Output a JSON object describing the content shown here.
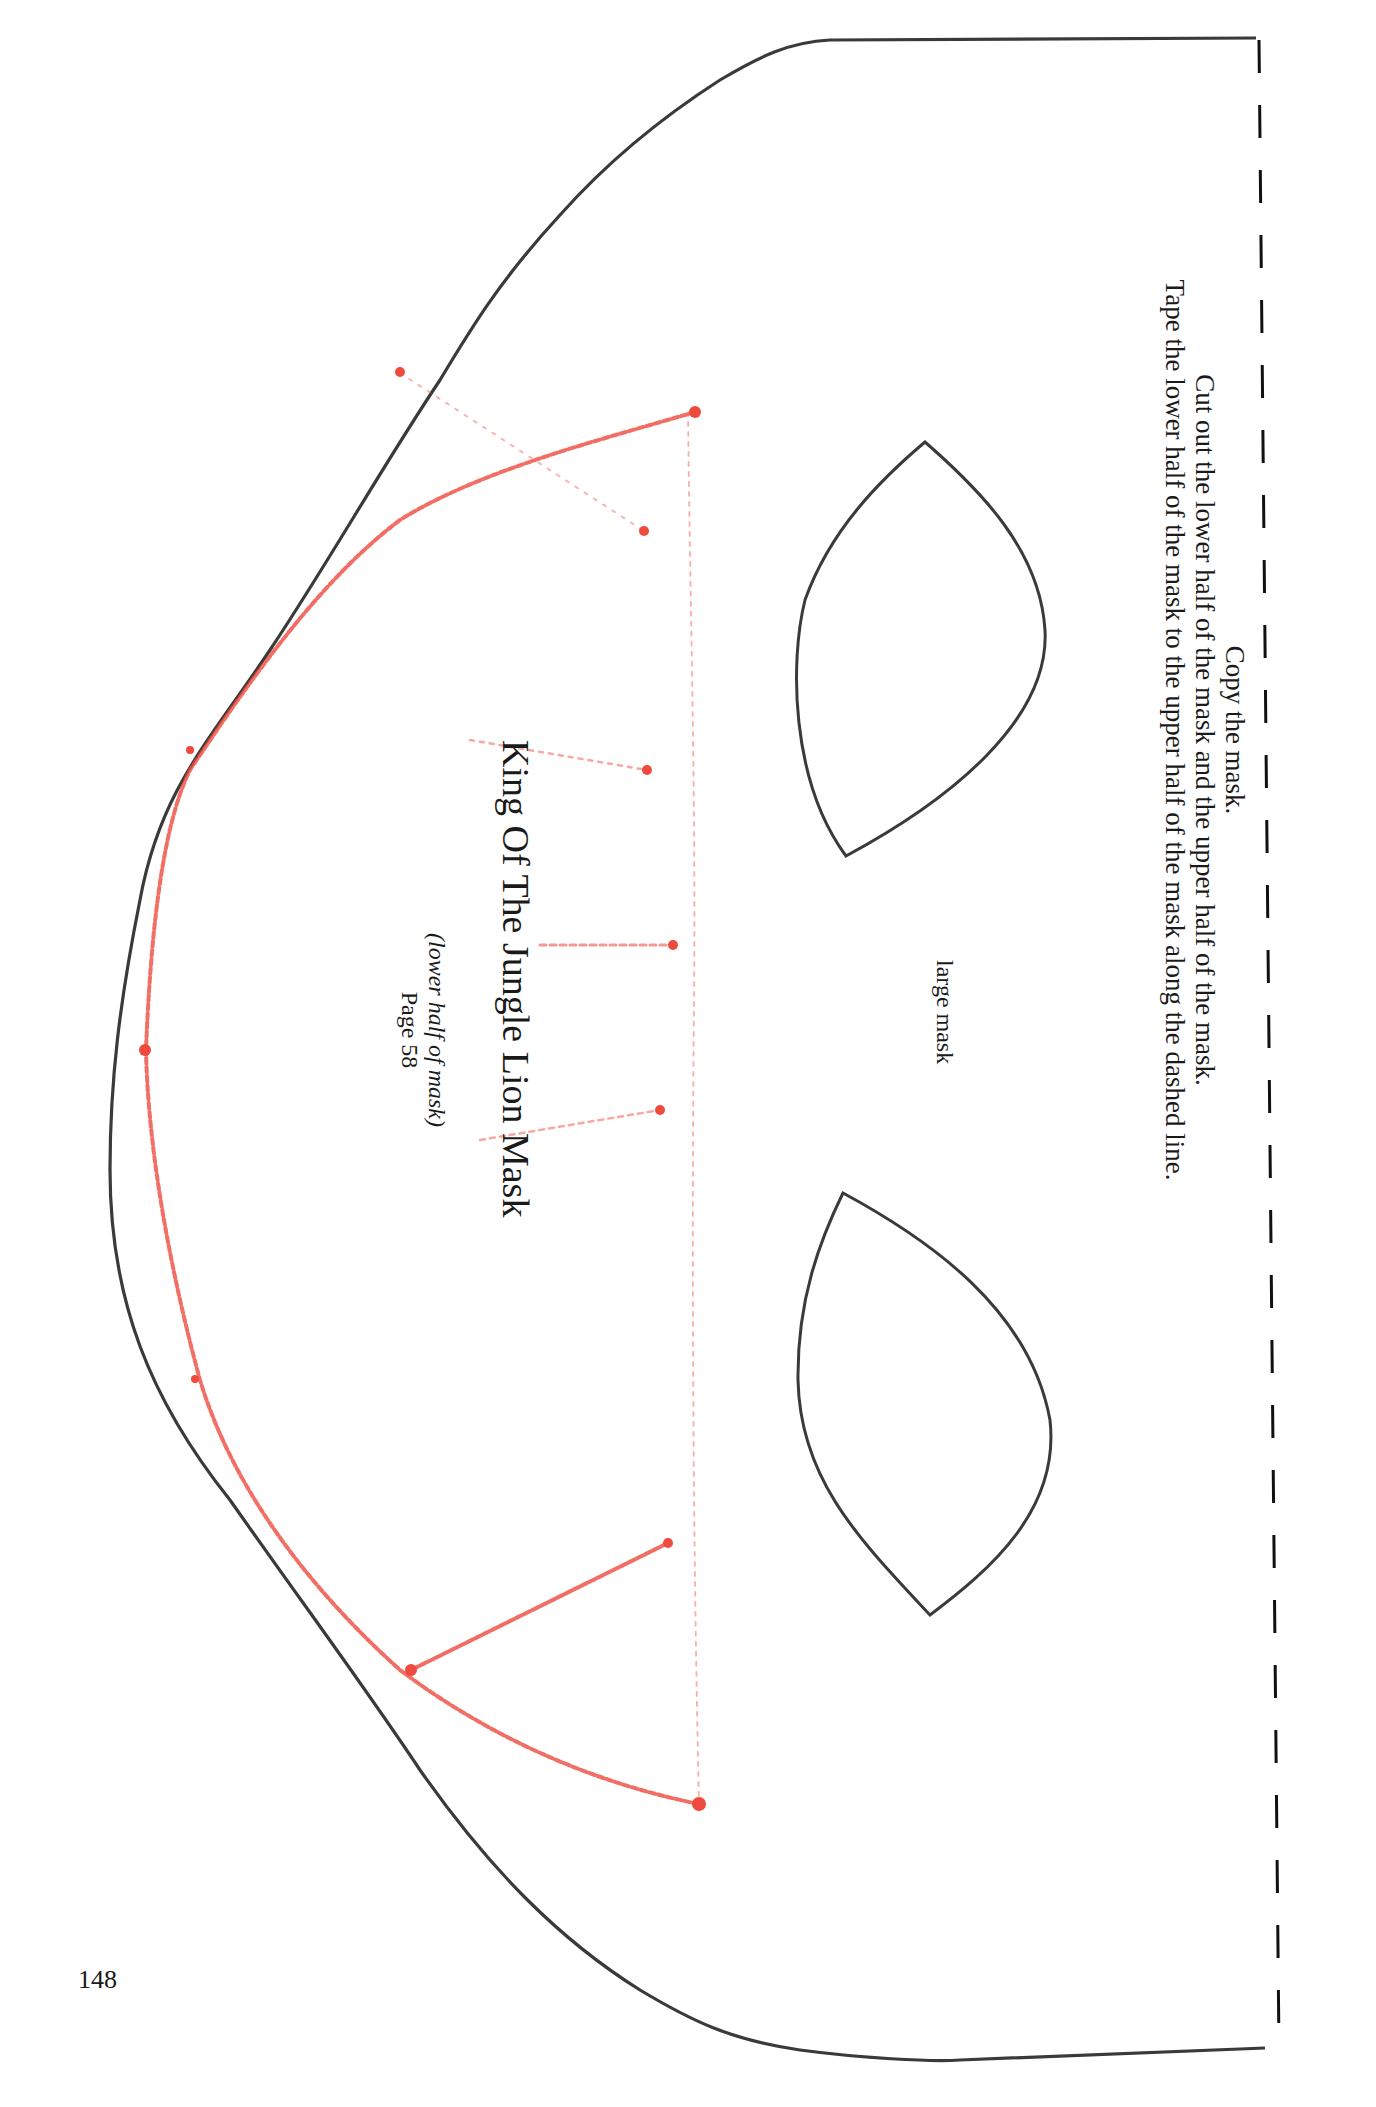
{
  "instructions": {
    "line1": "Copy the mask.",
    "line2": "Cut out the lower half of the mask and the upper half of the mask.",
    "line3": "Tape the lower half of the mask to the upper half of the mask along the dashed line."
  },
  "eye_label": "large mask",
  "title": "King Of The Jungle Lion Mask",
  "subtitle": "(lower half of mask)",
  "page_ref": "Page 58",
  "page_number": "148",
  "colors": {
    "outline": "#3a3a3a",
    "guide_red": "#ee4b3e",
    "dashed_line": "#111111"
  }
}
